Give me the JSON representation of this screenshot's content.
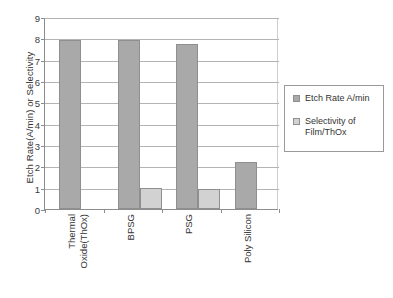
{
  "chart_data": {
    "type": "bar",
    "title": "",
    "xlabel": "",
    "ylabel": "Etch Rate(A/min) or Selectivity",
    "ylim": [
      0,
      9
    ],
    "ytick_labels": [
      "0",
      "1",
      "2",
      "3",
      "4",
      "5",
      "6",
      "7",
      "8",
      "9"
    ],
    "grid": true,
    "legend_position": "right",
    "categories": [
      "Thermal Oxide(ThOx)",
      "BPSG",
      "PSG",
      "Poly Silicon"
    ],
    "category_lines": [
      [
        "Thermal",
        "Oxide(ThOx)"
      ],
      [
        "BPSG",
        ""
      ],
      [
        "PSG",
        ""
      ],
      [
        "Poly Silicon",
        ""
      ]
    ],
    "series": [
      {
        "name": "Etch Rate A/min",
        "color": "#a9a9a9",
        "values": [
          7.9,
          7.9,
          7.75,
          2.2
        ]
      },
      {
        "name": "Selectivity of Film/ThOx",
        "color": "#d2d2d2",
        "values": [
          0,
          1.0,
          0.95,
          0
        ]
      }
    ]
  },
  "legend": {
    "entries": [
      {
        "label": "Etch Rate A/min",
        "swatch": "dark-gray-swatch"
      },
      {
        "label": "Selectivity of\nFilm/ThOx",
        "swatch": "light-gray-swatch"
      }
    ]
  },
  "axis": {
    "y_title": "Etch Rate(A/min) or Selectivity"
  }
}
